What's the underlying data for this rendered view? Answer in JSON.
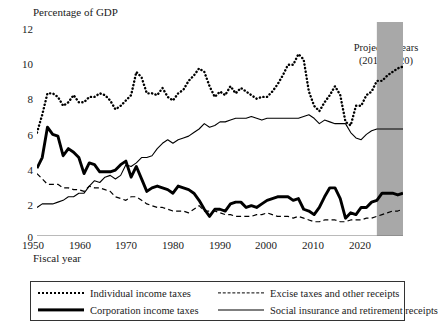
{
  "chart_data": {
    "type": "line",
    "title": "Percentage of GDP",
    "xlabel": "Fiscal year",
    "ylabel": "Percentage of GDP",
    "xlim": [
      1950,
      2020
    ],
    "ylim": [
      0,
      12
    ],
    "yticks": [
      "0",
      "2",
      "4",
      "6",
      "8",
      "10",
      "12"
    ],
    "xticks": [
      "1950",
      "1960",
      "1970",
      "1980",
      "1990",
      "2000",
      "2010",
      "2020"
    ],
    "grid": false,
    "legend_position": "below-axes",
    "annotation": {
      "line1": "Projected years",
      "line2": "(2015–2020)",
      "shaded_start": 2015,
      "shaded_end": 2020,
      "shade_color": "#a8a8a8"
    },
    "x": [
      1950,
      1951,
      1952,
      1953,
      1954,
      1955,
      1956,
      1957,
      1958,
      1959,
      1960,
      1961,
      1962,
      1963,
      1964,
      1965,
      1966,
      1967,
      1968,
      1969,
      1970,
      1971,
      1972,
      1973,
      1974,
      1975,
      1976,
      1977,
      1978,
      1979,
      1980,
      1981,
      1982,
      1983,
      1984,
      1985,
      1986,
      1987,
      1988,
      1989,
      1990,
      1991,
      1992,
      1993,
      1994,
      1995,
      1996,
      1997,
      1998,
      1999,
      2000,
      2001,
      2002,
      2003,
      2004,
      2005,
      2006,
      2007,
      2008,
      2009,
      2010,
      2011,
      2012,
      2013,
      2014,
      2015,
      2016,
      2017,
      2018,
      2019,
      2020
    ],
    "series": [
      {
        "name": "Individual income taxes",
        "style": "dotted",
        "values": [
          5.8,
          6.8,
          8.0,
          8.0,
          7.8,
          7.3,
          7.5,
          7.9,
          7.5,
          7.5,
          7.8,
          7.8,
          8.0,
          7.9,
          7.6,
          7.1,
          7.3,
          7.6,
          7.9,
          9.2,
          8.9,
          8.0,
          8.0,
          7.9,
          8.3,
          7.8,
          7.6,
          8.0,
          8.2,
          8.7,
          9.0,
          9.4,
          9.2,
          8.4,
          7.8,
          8.1,
          7.9,
          8.4,
          8.0,
          8.3,
          8.1,
          7.9,
          7.7,
          7.8,
          7.8,
          8.1,
          8.5,
          9.0,
          9.6,
          9.6,
          10.2,
          9.9,
          8.1,
          7.3,
          7.0,
          7.5,
          7.9,
          8.4,
          7.9,
          6.4,
          6.2,
          7.3,
          7.3,
          7.9,
          8.1,
          8.7,
          8.7,
          9.0,
          9.2,
          9.4,
          9.5
        ]
      },
      {
        "name": "Corporation income taxes",
        "style": "thick",
        "values": [
          3.8,
          4.4,
          6.1,
          5.7,
          5.6,
          4.5,
          4.9,
          4.7,
          4.4,
          3.5,
          4.1,
          4.0,
          3.6,
          3.6,
          3.6,
          3.7,
          4.0,
          4.2,
          3.3,
          3.9,
          3.2,
          2.5,
          2.7,
          2.8,
          2.7,
          2.6,
          2.4,
          2.8,
          2.7,
          2.6,
          2.4,
          2.0,
          1.5,
          1.1,
          1.5,
          1.5,
          1.4,
          1.8,
          1.9,
          1.9,
          1.6,
          1.7,
          1.6,
          1.8,
          2.0,
          2.1,
          2.2,
          2.2,
          2.2,
          2.0,
          2.1,
          1.5,
          1.4,
          1.2,
          1.6,
          2.2,
          2.7,
          2.7,
          2.1,
          1.0,
          1.3,
          1.2,
          1.6,
          1.6,
          1.9,
          2.0,
          2.4,
          2.4,
          2.4,
          2.3,
          2.4
        ]
      },
      {
        "name": "Excise taxes and other receipts",
        "style": "dashed",
        "values": [
          3.5,
          3.2,
          2.9,
          2.9,
          2.9,
          2.7,
          2.7,
          2.6,
          2.6,
          2.5,
          2.8,
          2.7,
          2.7,
          2.6,
          2.5,
          2.2,
          2.1,
          2.0,
          2.2,
          2.2,
          2.0,
          1.8,
          1.7,
          1.6,
          1.6,
          1.5,
          1.4,
          1.4,
          1.4,
          1.3,
          1.5,
          1.7,
          1.4,
          1.4,
          1.4,
          1.3,
          1.2,
          1.2,
          1.1,
          1.1,
          1.1,
          1.1,
          1.2,
          1.2,
          1.3,
          1.2,
          1.1,
          1.1,
          1.1,
          1.0,
          1.1,
          1.0,
          0.9,
          0.8,
          0.8,
          0.9,
          0.9,
          0.9,
          0.8,
          0.8,
          0.9,
          0.9,
          0.9,
          1.0,
          1.0,
          1.1,
          1.2,
          1.3,
          1.4,
          1.4,
          1.5
        ]
      },
      {
        "name": "Social insurance and retirement receipts",
        "style": "thin",
        "values": [
          1.6,
          1.8,
          1.8,
          1.8,
          1.9,
          2.0,
          2.2,
          2.2,
          2.4,
          2.4,
          2.8,
          3.1,
          3.0,
          3.3,
          3.4,
          3.2,
          3.4,
          4.0,
          3.9,
          4.1,
          4.4,
          4.4,
          4.5,
          4.9,
          5.2,
          5.4,
          5.2,
          5.4,
          5.5,
          5.6,
          5.8,
          6.0,
          6.3,
          6.1,
          6.2,
          6.4,
          6.4,
          6.5,
          6.6,
          6.6,
          6.6,
          6.7,
          6.6,
          6.5,
          6.6,
          6.6,
          6.6,
          6.6,
          6.6,
          6.6,
          6.6,
          6.7,
          6.8,
          6.6,
          6.3,
          6.5,
          6.4,
          6.3,
          6.3,
          6.3,
          5.8,
          5.5,
          5.4,
          5.7,
          5.9,
          6.0,
          6.0,
          6.0,
          6.0,
          6.0,
          6.0
        ]
      }
    ]
  },
  "legend": {
    "entries": [
      {
        "label": "Individual income taxes",
        "style": "dotted"
      },
      {
        "label": "Excise taxes and other receipts",
        "style": "dashed"
      },
      {
        "label": "Corporation income taxes",
        "style": "thick"
      },
      {
        "label": "Social insurance and retirement receipts",
        "style": "thin"
      }
    ]
  }
}
